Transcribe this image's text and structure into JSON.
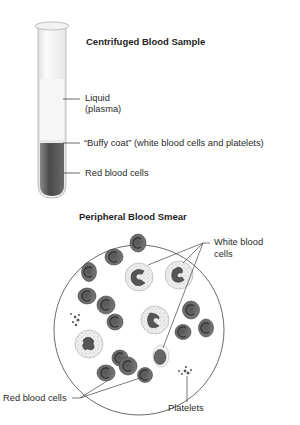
{
  "tube_panel": {
    "title": "Centrifuged Blood Sample",
    "labels": {
      "plasma_line1": "Liquid",
      "plasma_line2": "(plasma)",
      "buffy_coat": "“Buffy coat” (white blood cells and platelets)",
      "red_cells": "Red blood cells"
    }
  },
  "smear_panel": {
    "title": "Peripheral Blood Smear",
    "labels": {
      "wbc_line1": "White blood",
      "wbc_line2": "cells",
      "rbc": "Red blood cells",
      "platelets": "Platelets"
    }
  },
  "colors": {
    "rbc_fill": "#6e6e6e",
    "tube_red_layer": "#5c5c5c",
    "plasma": "#f4f4f4",
    "line": "#444444"
  }
}
